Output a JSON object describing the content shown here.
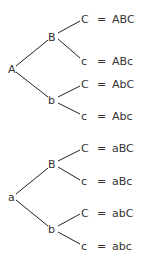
{
  "trees": [
    {
      "root": "A",
      "branches": [
        {
          "node": "B",
          "leaves": [
            {
              "leaf": "C",
              "result": "ABC"
            },
            {
              "leaf": "c",
              "result": "ABc"
            }
          ]
        },
        {
          "node": "b",
          "leaves": [
            {
              "leaf": "C",
              "result": "AbC"
            },
            {
              "leaf": "c",
              "result": "Abc"
            }
          ]
        }
      ]
    },
    {
      "root": "a",
      "branches": [
        {
          "node": "B",
          "leaves": [
            {
              "leaf": "C",
              "result": "aBC"
            },
            {
              "leaf": "c",
              "result": "aBc"
            }
          ]
        },
        {
          "node": "b",
          "leaves": [
            {
              "leaf": "C",
              "result": "abC"
            },
            {
              "leaf": "c",
              "result": "abc"
            }
          ]
        }
      ]
    }
  ],
  "equals": "="
}
